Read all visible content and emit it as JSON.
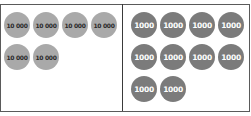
{
  "left_panel": {
    "coin_label": "10 000",
    "coin_count": 6,
    "coin_color": "#a9a9a9",
    "text_color": "#2a2a2a",
    "coins": [
      "10 000",
      "10 000",
      "10 000",
      "10 000",
      "10 000",
      "10 000"
    ]
  },
  "right_panel": {
    "coin_label": "1000",
    "coin_count": 10,
    "coin_color": "#7b7b7b",
    "text_color": "#ffffff",
    "coins": [
      "1000",
      "1000",
      "1000",
      "1000",
      "1000",
      "1000",
      "1000",
      "1000",
      "1000",
      "1000"
    ]
  }
}
